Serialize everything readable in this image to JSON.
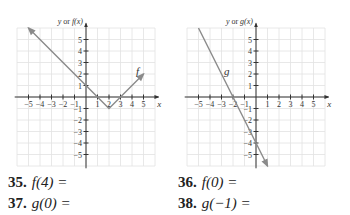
{
  "graphs": [
    {
      "id": "f",
      "ylabel_prefix": "y or ",
      "ylabel_fn": "f(x)",
      "xlabel": "x",
      "curve_label": "f",
      "x_ticks": [
        "−5",
        "−4",
        "−3",
        "−2",
        "−1",
        "1",
        "2",
        "3",
        "4",
        "5"
      ],
      "y_ticks_pos": [
        "1",
        "2",
        "3",
        "4",
        "5"
      ],
      "y_ticks_neg": [
        "−1",
        "−2",
        "−3",
        "−4",
        "−5"
      ]
    },
    {
      "id": "g",
      "ylabel_prefix": "y or ",
      "ylabel_fn": "g(x)",
      "xlabel": "x",
      "curve_label": "g",
      "x_ticks": [
        "−5",
        "−4",
        "−3",
        "−2",
        "−1",
        "1",
        "2",
        "3",
        "4",
        "5"
      ],
      "y_ticks_pos": [
        "1",
        "2",
        "3",
        "4",
        "5"
      ],
      "y_ticks_neg": [
        "−1",
        "−2",
        "−3",
        "−4",
        "−5"
      ]
    }
  ],
  "exercises": [
    {
      "num": "35.",
      "expr": "f(4) ="
    },
    {
      "num": "36.",
      "expr": "f(0) ="
    },
    {
      "num": "37.",
      "expr": "g(0) ="
    },
    {
      "num": "38.",
      "expr": "g(−1) ="
    }
  ],
  "chart_data": [
    {
      "type": "line",
      "title": "",
      "xlabel": "x",
      "ylabel": "y or f(x)",
      "xlim": [
        -6,
        6
      ],
      "ylim": [
        -6,
        6
      ],
      "grid": true,
      "series": [
        {
          "name": "f",
          "x": [
            -5,
            2,
            5
          ],
          "y": [
            6,
            -1,
            2
          ],
          "note": "f(x) = |x-2| - 1, arrows at both ends"
        }
      ]
    },
    {
      "type": "line",
      "title": "",
      "xlabel": "x",
      "ylabel": "y or g(x)",
      "xlim": [
        -6,
        6
      ],
      "ylim": [
        -6,
        6
      ],
      "grid": true,
      "series": [
        {
          "name": "g",
          "x": [
            -5,
            1
          ],
          "y": [
            6,
            -6
          ],
          "note": "g(x) = -2x - 4, arrow at upper end"
        }
      ]
    }
  ]
}
